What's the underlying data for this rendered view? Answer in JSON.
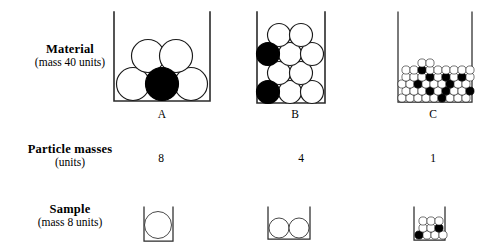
{
  "diagram": {
    "rows": [
      {
        "id": "material",
        "title": "Material",
        "subtitle": "(mass 40 units)"
      },
      {
        "id": "particle-masses",
        "title": "Particle masses",
        "subtitle": "(units)"
      },
      {
        "id": "sample",
        "title": "Sample",
        "subtitle": "(mass 8 units)"
      }
    ],
    "columns": [
      {
        "id": "a",
        "letter": "A",
        "particle_mass": "8"
      },
      {
        "id": "b",
        "letter": "B",
        "particle_mass": "4"
      },
      {
        "id": "c",
        "letter": "C",
        "particle_mass": "1"
      }
    ],
    "colors": {
      "open_particle": "#ffffff",
      "filled_particle": "#000000",
      "outline": "#1a1a1a",
      "container_wall": "#2b2b2b",
      "background": "#ffffff"
    },
    "material_containers": {
      "a": {
        "particle_radius": 16.5,
        "particles": [
          {
            "cx": 23,
            "cy": 74,
            "filled": false
          },
          {
            "cx": 52,
            "cy": 74,
            "filled": true
          },
          {
            "cx": 81,
            "cy": 74,
            "filled": false
          },
          {
            "cx": 38,
            "cy": 46,
            "filled": false
          },
          {
            "cx": 66,
            "cy": 46,
            "filled": false
          }
        ]
      },
      "b": {
        "particle_radius": 11.5,
        "particles": [
          {
            "cx": 13,
            "cy": 82,
            "filled": true
          },
          {
            "cx": 35,
            "cy": 82,
            "filled": false
          },
          {
            "cx": 57,
            "cy": 82,
            "filled": false
          },
          {
            "cx": 24,
            "cy": 63,
            "filled": false
          },
          {
            "cx": 46,
            "cy": 63,
            "filled": false
          },
          {
            "cx": 13,
            "cy": 44,
            "filled": true
          },
          {
            "cx": 35,
            "cy": 44,
            "filled": false
          },
          {
            "cx": 57,
            "cy": 44,
            "filled": false
          },
          {
            "cx": 24,
            "cy": 25,
            "filled": false
          },
          {
            "cx": 46,
            "cy": 25,
            "filled": false
          }
        ]
      },
      "c": {
        "particle_radius": 4.1,
        "particles": [
          {
            "cx": 6,
            "cy": 88,
            "filled": false
          },
          {
            "cx": 14,
            "cy": 88,
            "filled": false
          },
          {
            "cx": 22,
            "cy": 88,
            "filled": false
          },
          {
            "cx": 30,
            "cy": 88,
            "filled": false
          },
          {
            "cx": 38,
            "cy": 88,
            "filled": false
          },
          {
            "cx": 46,
            "cy": 88,
            "filled": true
          },
          {
            "cx": 54,
            "cy": 88,
            "filled": false
          },
          {
            "cx": 62,
            "cy": 88,
            "filled": false
          },
          {
            "cx": 10,
            "cy": 81,
            "filled": false
          },
          {
            "cx": 18,
            "cy": 81,
            "filled": false
          },
          {
            "cx": 26,
            "cy": 81,
            "filled": false
          },
          {
            "cx": 34,
            "cy": 81,
            "filled": true
          },
          {
            "cx": 42,
            "cy": 81,
            "filled": false
          },
          {
            "cx": 50,
            "cy": 81,
            "filled": true
          },
          {
            "cx": 58,
            "cy": 81,
            "filled": false
          },
          {
            "cx": 66,
            "cy": 81,
            "filled": false
          },
          {
            "cx": 6,
            "cy": 74,
            "filled": false
          },
          {
            "cx": 14,
            "cy": 74,
            "filled": false
          },
          {
            "cx": 22,
            "cy": 74,
            "filled": true
          },
          {
            "cx": 30,
            "cy": 74,
            "filled": false
          },
          {
            "cx": 38,
            "cy": 74,
            "filled": false
          },
          {
            "cx": 46,
            "cy": 74,
            "filled": false
          },
          {
            "cx": 54,
            "cy": 74,
            "filled": false
          },
          {
            "cx": 62,
            "cy": 74,
            "filled": true
          },
          {
            "cx": 70,
            "cy": 74,
            "filled": false
          },
          {
            "cx": 10,
            "cy": 67,
            "filled": false
          },
          {
            "cx": 18,
            "cy": 67,
            "filled": false
          },
          {
            "cx": 26,
            "cy": 67,
            "filled": false
          },
          {
            "cx": 34,
            "cy": 67,
            "filled": true
          },
          {
            "cx": 42,
            "cy": 67,
            "filled": false
          },
          {
            "cx": 50,
            "cy": 67,
            "filled": true
          },
          {
            "cx": 58,
            "cy": 67,
            "filled": false
          },
          {
            "cx": 66,
            "cy": 67,
            "filled": true
          },
          {
            "cx": 6,
            "cy": 60,
            "filled": false
          },
          {
            "cx": 14,
            "cy": 60,
            "filled": false
          },
          {
            "cx": 22,
            "cy": 60,
            "filled": true
          },
          {
            "cx": 30,
            "cy": 60,
            "filled": false
          },
          {
            "cx": 38,
            "cy": 60,
            "filled": false
          },
          {
            "cx": 46,
            "cy": 60,
            "filled": true
          },
          {
            "cx": 54,
            "cy": 60,
            "filled": false
          },
          {
            "cx": 62,
            "cy": 60,
            "filled": false
          },
          {
            "cx": 70,
            "cy": 60,
            "filled": false
          },
          {
            "cx": 26,
            "cy": 53,
            "filled": false
          },
          {
            "cx": 34,
            "cy": 53,
            "filled": true
          }
        ]
      }
    },
    "sample_containers": {
      "a": {
        "particle_radius": 13.5,
        "particles": [
          {
            "cx": 16,
            "cy": 20,
            "filled": false
          }
        ]
      },
      "b": {
        "particle_radius": 10,
        "particles": [
          {
            "cx": 12,
            "cy": 23,
            "filled": false
          },
          {
            "cx": 32,
            "cy": 23,
            "filled": false
          }
        ]
      },
      "c": {
        "particle_radius": 4.1,
        "particles": [
          {
            "cx": 6,
            "cy": 30,
            "filled": true
          },
          {
            "cx": 14,
            "cy": 30,
            "filled": false
          },
          {
            "cx": 22,
            "cy": 30,
            "filled": false
          },
          {
            "cx": 10,
            "cy": 23,
            "filled": false
          },
          {
            "cx": 18,
            "cy": 23,
            "filled": false
          },
          {
            "cx": 26,
            "cy": 23,
            "filled": true
          },
          {
            "cx": 6,
            "cy": 16,
            "filled": false
          },
          {
            "cx": 14,
            "cy": 16,
            "filled": false
          },
          {
            "cx": 22,
            "cy": 16,
            "filled": false
          }
        ]
      }
    }
  }
}
